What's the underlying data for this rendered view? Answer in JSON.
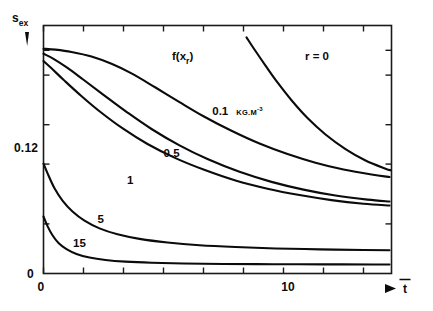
{
  "chart_data": {
    "type": "line",
    "title": "",
    "xlabel": "t",
    "xlabel_note": "t with overbar",
    "ylabel": "s",
    "ylabel_sub": "ex",
    "grid": false,
    "legend_position": "inline-curve-labels",
    "xlim": [
      0,
      17.4
    ],
    "ylim": [
      0,
      0.272
    ],
    "x_ticks": [
      0,
      2,
      4,
      6,
      8,
      10,
      12,
      14,
      16
    ],
    "x_tick_labels": {
      "0": "0",
      "10": "10"
    },
    "y_ticks": [
      0,
      0.0544,
      0.12,
      0.1632,
      0.2176,
      0.2448
    ],
    "y_tick_labels": {
      "0": "0",
      "0.12": "0.12"
    },
    "annotations": [
      {
        "text": "f(x",
        "sub": "r",
        "tail": ")",
        "name": "f-of-xr",
        "x": 0.455,
        "y": 0.895
      },
      {
        "text": "r = 0",
        "name": "r-equals-zero",
        "x": 0.8,
        "y": 0.845
      }
    ],
    "axis_arrow_x": "right-arrow",
    "axis_arrow_y": "up-arrow",
    "series": [
      {
        "name": "0.1",
        "label": "0.1",
        "unit": "KG.M",
        "unit_exp": "-3",
        "label_x": 0.485,
        "label_y": 0.64,
        "points": [
          [
            0,
            0.2465
          ],
          [
            0.6,
            0.2455
          ],
          [
            1.4,
            0.243
          ],
          [
            2.4,
            0.238
          ],
          [
            3.4,
            0.23
          ],
          [
            4.4,
            0.2195
          ],
          [
            5.6,
            0.204
          ],
          [
            6.8,
            0.188
          ],
          [
            8.0,
            0.1725
          ],
          [
            9.4,
            0.1565
          ],
          [
            10.8,
            0.1425
          ],
          [
            12.2,
            0.131
          ],
          [
            13.6,
            0.1215
          ],
          [
            15.0,
            0.114
          ],
          [
            16.4,
            0.1085
          ],
          [
            17.3,
            0.1058
          ]
        ]
      },
      {
        "name": "0.5",
        "label": "0.5",
        "label_x": 0.345,
        "label_y": 0.47,
        "points": [
          [
            0,
            0.241
          ],
          [
            0.5,
            0.2355
          ],
          [
            1.2,
            0.2255
          ],
          [
            2.0,
            0.2125
          ],
          [
            3.0,
            0.196
          ],
          [
            4.2,
            0.1765
          ],
          [
            5.4,
            0.1585
          ],
          [
            6.8,
            0.1405
          ],
          [
            8.2,
            0.1255
          ],
          [
            9.8,
            0.1115
          ],
          [
            11.4,
            0.1005
          ],
          [
            13.0,
            0.092
          ],
          [
            14.6,
            0.0855
          ],
          [
            16.2,
            0.081
          ],
          [
            17.3,
            0.079
          ]
        ]
      },
      {
        "name": "1",
        "label": "1",
        "label_x": 0.24,
        "label_y": 0.36,
        "points": [
          [
            0,
            0.233
          ],
          [
            0.4,
            0.225
          ],
          [
            1.0,
            0.2125
          ],
          [
            1.8,
            0.1965
          ],
          [
            2.8,
            0.178
          ],
          [
            4.0,
            0.1585
          ],
          [
            5.2,
            0.142
          ],
          [
            6.6,
            0.1265
          ],
          [
            8.0,
            0.114
          ],
          [
            9.6,
            0.102
          ],
          [
            11.2,
            0.093
          ],
          [
            12.8,
            0.086
          ],
          [
            14.4,
            0.0805
          ],
          [
            16.0,
            0.0765
          ],
          [
            17.3,
            0.0745
          ]
        ]
      },
      {
        "name": "5",
        "label": "5",
        "label_x": 0.155,
        "label_y": 0.205,
        "points": [
          [
            0,
            0.1205
          ],
          [
            0.25,
            0.1075
          ],
          [
            0.55,
            0.0935
          ],
          [
            0.95,
            0.08
          ],
          [
            1.45,
            0.068
          ],
          [
            2.05,
            0.058
          ],
          [
            2.8,
            0.0495
          ],
          [
            3.7,
            0.043
          ],
          [
            4.8,
            0.038
          ],
          [
            6.2,
            0.034
          ],
          [
            7.8,
            0.031
          ],
          [
            9.6,
            0.029
          ],
          [
            11.6,
            0.0275
          ],
          [
            13.8,
            0.0265
          ],
          [
            16.0,
            0.0258
          ],
          [
            17.3,
            0.0255
          ]
        ]
      },
      {
        "name": "15",
        "label": "15",
        "label_x": 0.085,
        "label_y": 0.105,
        "points": [
          [
            0,
            0.0625
          ],
          [
            0.2,
            0.052
          ],
          [
            0.45,
            0.042
          ],
          [
            0.75,
            0.0335
          ],
          [
            1.15,
            0.0268
          ],
          [
            1.65,
            0.0215
          ],
          [
            2.3,
            0.0175
          ],
          [
            3.1,
            0.0148
          ],
          [
            4.1,
            0.013
          ],
          [
            5.4,
            0.0118
          ],
          [
            7.0,
            0.011
          ],
          [
            9.0,
            0.0105
          ],
          [
            11.5,
            0.0102
          ],
          [
            14.0,
            0.01
          ],
          [
            16.5,
            0.0099
          ],
          [
            17.3,
            0.0098
          ]
        ]
      },
      {
        "name": "r0",
        "label": "",
        "label_x": null,
        "label_y": null,
        "points": [
          [
            10.15,
            0.259
          ],
          [
            10.6,
            0.244
          ],
          [
            11.1,
            0.228
          ],
          [
            11.7,
            0.2095
          ],
          [
            12.4,
            0.19
          ],
          [
            13.2,
            0.1705
          ],
          [
            14.1,
            0.1525
          ],
          [
            15.1,
            0.1365
          ],
          [
            16.1,
            0.124
          ],
          [
            17.1,
            0.115
          ],
          [
            17.35,
            0.1132
          ]
        ]
      }
    ]
  }
}
